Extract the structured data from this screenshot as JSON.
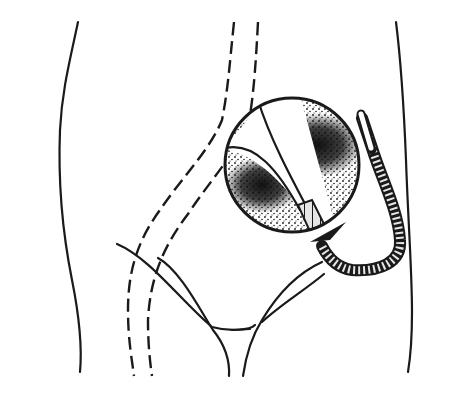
{
  "figure": {
    "type": "medical line illustration",
    "description": "Outline of lower torso/pelvis with dashed vessel outline, magnified circular inset showing a catheter inside a stippled vessel, and a flexible segmented catheter with arrow indicating insertion direction",
    "caption": "",
    "colors": {
      "ink": "#1a1a1a",
      "background": "#ffffff",
      "catheter_fill": "#e6e6e6"
    },
    "elements": [
      {
        "name": "torso-outline-left",
        "label": "Left body contour"
      },
      {
        "name": "torso-outline-right",
        "label": "Right body contour"
      },
      {
        "name": "vessel-dashed-outline",
        "label": "Dashed vessel path"
      },
      {
        "name": "magnified-inset",
        "label": "Circular magnified view of vessel with catheter"
      },
      {
        "name": "catheter",
        "label": "Segmented flexible catheter"
      },
      {
        "name": "insertion-arrow",
        "label": "Arrow indicating insertion"
      },
      {
        "name": "groin-lines",
        "label": "Inguinal / groin contour lines"
      }
    ]
  }
}
